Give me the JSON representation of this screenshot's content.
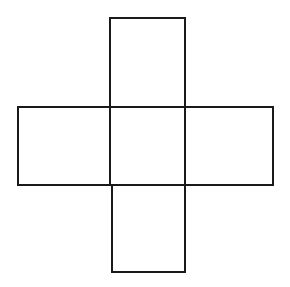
{
  "diagram": {
    "type": "cross-net",
    "stroke_color": "#1a1a1a",
    "background": "#ffffff",
    "stroke_width": 2,
    "squares": [
      {
        "name": "top",
        "x": 110,
        "y": 18,
        "w": 75,
        "h": 89
      },
      {
        "name": "left",
        "x": 18,
        "y": 107,
        "w": 92,
        "h": 78
      },
      {
        "name": "center",
        "x": 110,
        "y": 107,
        "w": 75,
        "h": 78
      },
      {
        "name": "right",
        "x": 185,
        "y": 107,
        "w": 88,
        "h": 78
      },
      {
        "name": "bottom",
        "x": 112,
        "y": 185,
        "w": 73,
        "h": 87
      }
    ]
  }
}
